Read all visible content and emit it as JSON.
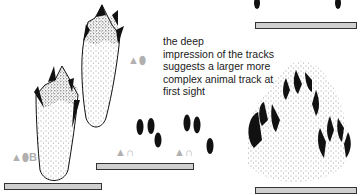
{
  "caption": {
    "lines": [
      "the deep",
      "impression of the tracks",
      "suggests a larger more",
      "complex animal track at",
      "first sight"
    ]
  },
  "symbols": {
    "upper_track": {
      "shapes": [
        "triangle",
        "oval"
      ]
    },
    "lower_track": {
      "shapes": [
        "triangle",
        "oval"
      ],
      "letter": "B"
    },
    "small_tracks_left": {
      "shapes": [
        "triangle",
        "arch"
      ]
    },
    "small_tracks_right": {
      "shapes": [
        "triangle",
        "arch"
      ]
    }
  },
  "colors": {
    "ink": "#111111",
    "symbol_gray": "#b0b0b0",
    "scalebar_fill": "#cfcfcf"
  }
}
